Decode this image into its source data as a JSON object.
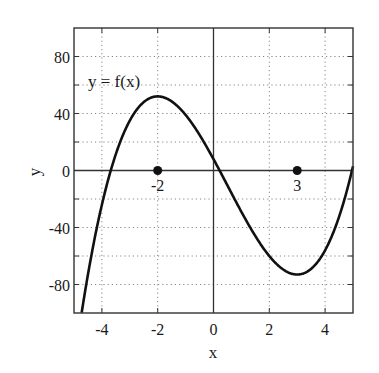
{
  "chart_data": {
    "type": "line",
    "title": "",
    "xlabel": "x",
    "ylabel": "y",
    "xlim": [
      -5,
      5
    ],
    "ylim": [
      -100,
      100
    ],
    "grid": true,
    "grid_style": "dotted",
    "x_ticks": [
      -4,
      -2,
      0,
      2,
      4
    ],
    "x_tick_labels": [
      "-4",
      "-2",
      "0",
      "2",
      "4"
    ],
    "y_ticks": [
      -80,
      -40,
      0,
      40,
      80
    ],
    "y_tick_labels": [
      "-80",
      "-40",
      "0",
      "40",
      "80"
    ],
    "y_minor_ticks": [
      -100,
      -60,
      -20,
      20,
      60,
      100
    ],
    "series": [
      {
        "name": "y = f(x)",
        "function_approx": "2x^3 - 3x^2 - 36x + 8",
        "coefficients": [
          2,
          -3,
          -36,
          8
        ],
        "x": [
          -4.75,
          -4.5,
          -4,
          -3.5,
          -3,
          -2.5,
          -2,
          -1.5,
          -1,
          -0.5,
          0,
          0.5,
          1,
          1.5,
          2,
          2.5,
          3,
          3.5,
          4,
          4.5,
          5
        ],
        "y": [
          -103,
          -77.5,
          -32,
          2.8,
          27,
          42.5,
          52,
          45.5,
          39,
          25,
          8,
          -10.5,
          -29,
          -45.5,
          -52,
          -62.5,
          -73,
          -67.3,
          -56,
          -35,
          3
        ],
        "color": "#111111"
      }
    ],
    "annotations": [
      {
        "text": "y = f(x)",
        "x": -3.8,
        "y": 60
      },
      {
        "text": "-2",
        "x": -2,
        "y": 0,
        "marker": "point"
      },
      {
        "text": "3",
        "x": 3,
        "y": 0,
        "marker": "point"
      }
    ],
    "critical_points": [
      {
        "x": -2,
        "label": "-2",
        "type": "local max",
        "f": 52
      },
      {
        "x": 3,
        "label": "3",
        "type": "local min",
        "f": -73
      }
    ]
  },
  "labels": {
    "curve": "y = f(x)",
    "xlabel": "x",
    "ylabel": "y",
    "point_a": "-2",
    "point_b": "3"
  }
}
